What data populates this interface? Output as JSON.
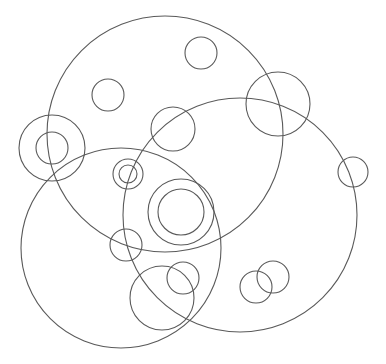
{
  "diagram": {
    "width": 386,
    "height": 364,
    "background": "#ffffff",
    "stroke_color": "#5a5a5a",
    "circles": [
      {
        "name": "large-circle-top",
        "cx": 165,
        "cy": 134,
        "r": 118
      },
      {
        "name": "large-circle-left",
        "cx": 121,
        "cy": 248,
        "r": 100
      },
      {
        "name": "large-circle-right",
        "cx": 240,
        "cy": 215,
        "r": 117
      },
      {
        "name": "small-circle-top-left",
        "cx": 108,
        "cy": 95,
        "r": 16
      },
      {
        "name": "small-circle-top",
        "cx": 201,
        "cy": 53,
        "r": 16
      },
      {
        "name": "medium-circle-center",
        "cx": 173,
        "cy": 129,
        "r": 22
      },
      {
        "name": "medium-circle-top-right",
        "cx": 278,
        "cy": 104,
        "r": 32
      },
      {
        "name": "small-circle-right",
        "cx": 353,
        "cy": 172,
        "r": 15
      },
      {
        "name": "ring-left-outer",
        "cx": 52,
        "cy": 148,
        "r": 33
      },
      {
        "name": "ring-left-inner",
        "cx": 52,
        "cy": 148,
        "r": 16
      },
      {
        "name": "ring-small-outer",
        "cx": 128,
        "cy": 174,
        "r": 15
      },
      {
        "name": "ring-small-inner",
        "cx": 128,
        "cy": 174,
        "r": 9
      },
      {
        "name": "ring-center-outer",
        "cx": 181,
        "cy": 212,
        "r": 33
      },
      {
        "name": "ring-center-inner",
        "cx": 181,
        "cy": 212,
        "r": 23
      },
      {
        "name": "small-circle-mid-left",
        "cx": 126,
        "cy": 245,
        "r": 16
      },
      {
        "name": "medium-circle-bottom",
        "cx": 162,
        "cy": 298,
        "r": 32
      },
      {
        "name": "small-circle-bottom",
        "cx": 183,
        "cy": 278,
        "r": 16
      },
      {
        "name": "small-circle-bottom-right-a",
        "cx": 256,
        "cy": 287,
        "r": 16
      },
      {
        "name": "small-circle-bottom-right-b",
        "cx": 273,
        "cy": 277,
        "r": 16
      }
    ]
  }
}
